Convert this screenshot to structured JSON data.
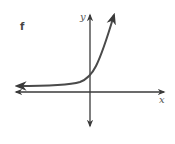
{
  "figure": {
    "panel_label": "f",
    "x_axis_label": "x",
    "y_axis_label": "y",
    "curve_description": "exponential growth curve approaching horizontal asymptote above x-axis on the left, crossing y-axis above origin, rising steeply on the right",
    "colors": {
      "axis": "#3a3a3a",
      "curve": "#4a4a4a",
      "text": "#555555"
    }
  }
}
